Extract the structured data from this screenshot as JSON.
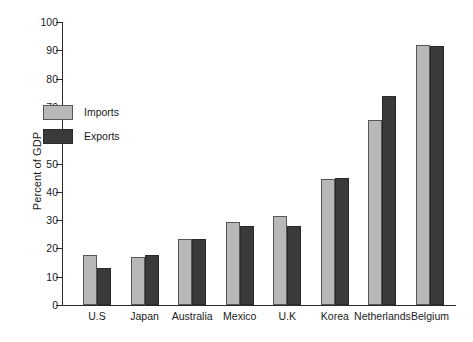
{
  "chart_data": {
    "type": "bar",
    "title": "",
    "xlabel": "",
    "ylabel": "Percent of GDP",
    "ylim": [
      0,
      100
    ],
    "ytick_step": 10,
    "yticks": [
      0,
      10,
      20,
      30,
      40,
      50,
      60,
      70,
      80,
      90,
      100
    ],
    "grid": false,
    "legend_position": "upper-left-inside",
    "categories": [
      "U.S",
      "Japan",
      "Australia",
      "Mexico",
      "U.K",
      "Korea",
      "Netherlands",
      "Belgium"
    ],
    "series": [
      {
        "name": "Imports",
        "color": "#b8b8b8",
        "values": [
          17.5,
          17,
          23.5,
          29.5,
          31.5,
          44.5,
          65.5,
          92
        ]
      },
      {
        "name": "Exports",
        "color": "#3a3a3a",
        "values": [
          13,
          17.5,
          23.5,
          28,
          28,
          45,
          74,
          91.5
        ]
      }
    ]
  },
  "axis": {
    "y_label": "Percent of GDP"
  }
}
